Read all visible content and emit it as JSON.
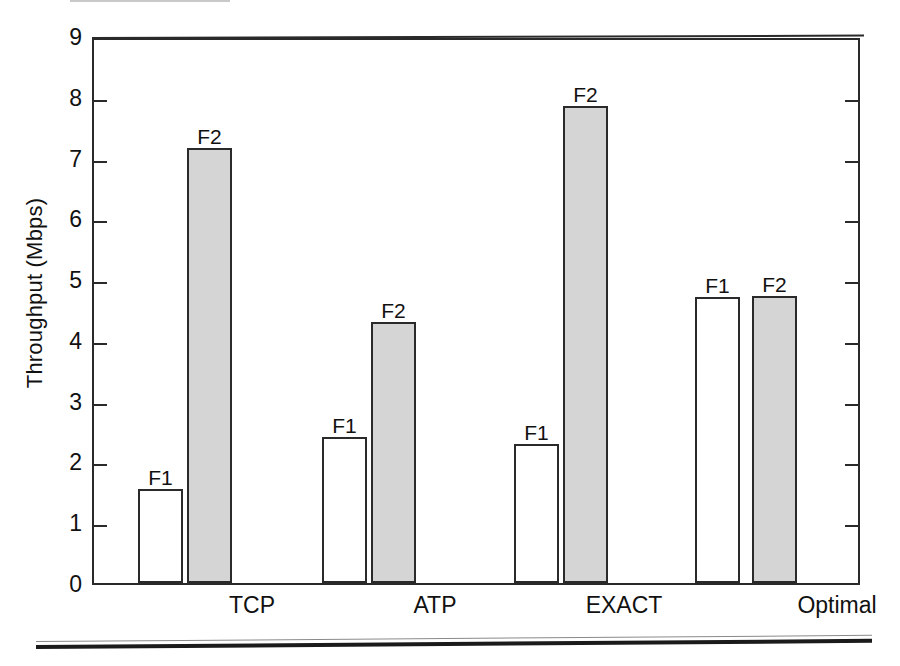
{
  "chart_data": {
    "type": "bar",
    "title": "",
    "xlabel": "",
    "ylabel": "Throughput (Mbps)",
    "ylim": [
      0,
      9
    ],
    "yticks": [
      0,
      1,
      2,
      3,
      4,
      5,
      6,
      7,
      8,
      9
    ],
    "ytick_labels": [
      "0",
      "1",
      "2",
      "3",
      "4",
      "5",
      "6",
      "7",
      "8",
      "9"
    ],
    "grid": false,
    "legend": "none",
    "categories": [
      "TCP",
      "ATP",
      "EXACT",
      "Optimal"
    ],
    "series": [
      {
        "name": "F1",
        "fill": "#ffffff",
        "values": [
          1.55,
          2.4,
          2.28,
          4.7
        ]
      },
      {
        "name": "F2",
        "fill": "#d5d5d5",
        "values": [
          7.15,
          4.3,
          7.85,
          4.72
        ]
      }
    ],
    "bar_labels": [
      [
        "F1",
        "F2"
      ],
      [
        "F1",
        "F2"
      ],
      [
        "F1",
        "F2"
      ],
      [
        "F1",
        "F2"
      ]
    ]
  },
  "axis": {
    "y_title": "Throughput (Mbps)",
    "y_ticks": [
      "9",
      "8",
      "7",
      "6",
      "5",
      "4",
      "3",
      "2",
      "1",
      "0"
    ]
  },
  "groups": [
    {
      "name": "TCP",
      "bars": [
        {
          "label": "F1",
          "value": 1.55,
          "style": "f1",
          "left": 44,
          "width": 45
        },
        {
          "label": "F2",
          "value": 7.15,
          "style": "f2",
          "left": 93,
          "width": 45
        }
      ]
    },
    {
      "name": "ATP",
      "bars": [
        {
          "label": "F1",
          "value": 2.4,
          "style": "f1",
          "left": 228,
          "width": 45
        },
        {
          "label": "F2",
          "value": 4.3,
          "style": "f2",
          "left": 277,
          "width": 45
        }
      ]
    },
    {
      "name": "EXACT",
      "bars": [
        {
          "label": "F1",
          "value": 2.28,
          "style": "f1",
          "left": 420,
          "width": 45
        },
        {
          "label": "F2",
          "value": 7.85,
          "style": "f2",
          "left": 469,
          "width": 45
        }
      ]
    },
    {
      "name": "Optimal",
      "bars": [
        {
          "label": "F1",
          "value": 4.7,
          "style": "f1",
          "left": 601,
          "width": 45
        },
        {
          "label": "F2",
          "value": 4.72,
          "style": "f2",
          "left": 658,
          "width": 45
        }
      ]
    }
  ],
  "category_labels": [
    {
      "text": "TCP",
      "center": 160
    },
    {
      "text": "ATP",
      "center": 343
    },
    {
      "text": "EXACT",
      "center": 532
    },
    {
      "text": "Optimal",
      "center": 745
    }
  ]
}
